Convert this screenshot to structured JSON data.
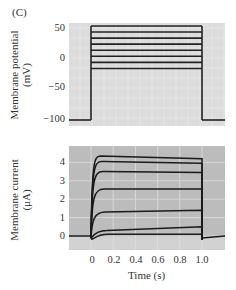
{
  "panel_label": "(C)",
  "chart_data": [
    {
      "type": "line",
      "title": "",
      "ylabel": "Membrane potential (mV)",
      "ylabel_lines": [
        "Membrane potential",
        "(mV)"
      ],
      "xlabel": "",
      "ylim": [
        -105,
        55
      ],
      "yticks": [
        50,
        0,
        -50,
        -100
      ],
      "ytick_labels": [
        "50",
        "0",
        "−50",
        "−100"
      ],
      "grid": true,
      "holding_potential_mV": -100,
      "step_start_s": 0,
      "step_end_s": 1.0,
      "series": [
        {
          "name": "step 1",
          "step_mV": -15
        },
        {
          "name": "step 2",
          "step_mV": -5
        },
        {
          "name": "step 3",
          "step_mV": 5
        },
        {
          "name": "step 4",
          "step_mV": 15
        },
        {
          "name": "step 5",
          "step_mV": 25
        },
        {
          "name": "step 6",
          "step_mV": 35
        },
        {
          "name": "step 7",
          "step_mV": 45
        },
        {
          "name": "step 8",
          "step_mV": 55
        }
      ]
    },
    {
      "type": "line",
      "title": "",
      "ylabel": "Membrane current (μA)",
      "ylabel_lines": [
        "Membrane current",
        "(μA)"
      ],
      "xlabel": "Time (s)",
      "xlim": [
        -0.2,
        1.2
      ],
      "ylim": [
        -0.7,
        4.8
      ],
      "xticks": [
        0,
        0.2,
        0.4,
        0.6,
        0.8,
        1.0
      ],
      "xtick_labels": [
        "0",
        "0.2",
        "0.4",
        "0.6",
        "0.8",
        "1.0"
      ],
      "yticks": [
        0,
        1,
        2,
        3,
        4
      ],
      "ytick_labels": [
        "0",
        "1",
        "2",
        "3",
        "4"
      ],
      "grid": true,
      "series": [
        {
          "name": "step 1",
          "peak_uA": 0.1,
          "end_uA": 0.1
        },
        {
          "name": "step 2",
          "peak_uA": 0.3,
          "end_uA": 0.5
        },
        {
          "name": "step 3",
          "peak_uA": 1.3,
          "end_uA": 1.4
        },
        {
          "name": "step 4",
          "peak_uA": 2.55,
          "end_uA": 2.55
        },
        {
          "name": "step 5",
          "peak_uA": 3.5,
          "end_uA": 3.45
        },
        {
          "name": "step 6",
          "peak_uA": 4.05,
          "end_uA": 3.95
        },
        {
          "name": "step 7",
          "peak_uA": 4.35,
          "end_uA": 4.2
        }
      ]
    }
  ]
}
